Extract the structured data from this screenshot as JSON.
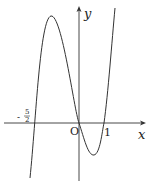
{
  "figure": {
    "type": "function-graph",
    "axes": {
      "x_label": "x",
      "y_label": "y",
      "origin_label": "O",
      "tick_labels": {
        "neg_root_num": "5",
        "neg_root_den": "2",
        "neg_sign": "-",
        "pos_root": "1"
      }
    },
    "curve": {
      "roots": [
        -2.5,
        0,
        1
      ],
      "local_max": "left of y-axis, near top",
      "local_min": "between 0 and 1, below x-axis"
    }
  }
}
